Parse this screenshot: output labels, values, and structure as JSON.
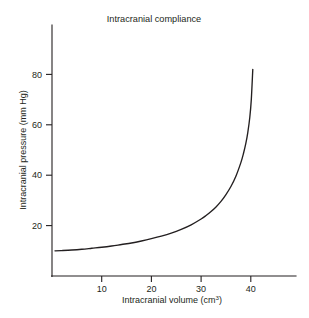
{
  "chart_data": {
    "type": "line",
    "title": "Intracranial compliance",
    "xlabel": "Intracranial volume (cm³)",
    "xlabel_base": "Intracranial volume (cm",
    "xlabel_sup": "3",
    "xlabel_tail": ")",
    "ylabel": "Intracranial pressure (mm Hg)",
    "xlim": [
      0,
      49
    ],
    "ylim": [
      0,
      91
    ],
    "xticks": [
      10,
      20,
      30,
      40
    ],
    "yticks": [
      20,
      40,
      60,
      80
    ],
    "xtick_labels": [
      "10",
      "20",
      "30",
      "40"
    ],
    "ytick_labels": [
      "20",
      "40",
      "60",
      "80"
    ],
    "grid": false,
    "legend": "none",
    "series": [
      {
        "name": "Pressure-volume curve",
        "color": "#231f20",
        "x": [
          0.6,
          2,
          4,
          6,
          8,
          10,
          12,
          14,
          16,
          18,
          20,
          22,
          24,
          26,
          28,
          30,
          31,
          32,
          33,
          34,
          35,
          36,
          37,
          38,
          38.5,
          39,
          39.4,
          39.8,
          40.1,
          40.4
        ],
        "y": [
          10.0,
          10.1,
          10.3,
          10.6,
          11.0,
          11.4,
          11.9,
          12.5,
          13.1,
          13.9,
          14.8,
          15.8,
          17.0,
          18.5,
          20.3,
          22.6,
          24.0,
          25.6,
          27.4,
          29.6,
          32.3,
          35.5,
          39.6,
          45.0,
          48.4,
          52.6,
          57.0,
          63.0,
          70.0,
          82.0
        ]
      }
    ],
    "annotations": []
  },
  "figure": {
    "background_color": "#ffffff",
    "ink_color": "#231f20"
  }
}
